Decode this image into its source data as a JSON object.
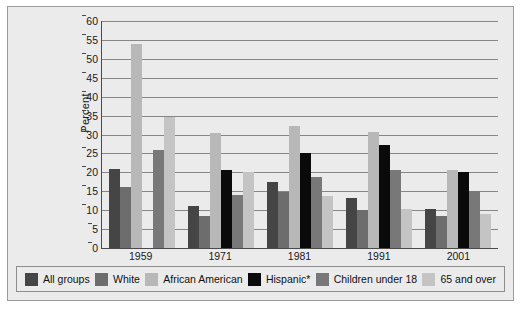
{
  "chart_data": {
    "type": "bar",
    "title": "",
    "xlabel": "",
    "ylabel": "Percent",
    "ylim": [
      0,
      60
    ],
    "ytick_step": 5,
    "grid": true,
    "legend_position": "bottom",
    "categories": [
      "1959",
      "1971",
      "1981",
      "1991",
      "2001"
    ],
    "yticks": [
      "0",
      "5",
      "10",
      "15",
      "20",
      "25",
      "30",
      "35",
      "40",
      "45",
      "50",
      "55",
      "60"
    ],
    "series": [
      {
        "name": "All groups",
        "color": "#454545",
        "values": [
          21.0,
          11.0,
          17.5,
          13.3,
          10.3
        ]
      },
      {
        "name": "White",
        "color": "#6d6d6d",
        "values": [
          16.0,
          8.4,
          14.8,
          10.0,
          8.4
        ]
      },
      {
        "name": "African American",
        "color": "#b8b8b8",
        "values": [
          54.0,
          30.5,
          32.2,
          30.7,
          20.5
        ]
      },
      {
        "name": "Hispanic*",
        "color": "#0a0a0a",
        "values": [
          null,
          20.7,
          25.0,
          27.3,
          20.0
        ]
      },
      {
        "name": "Children under 18",
        "color": "#787878",
        "values": [
          25.8,
          14.0,
          18.7,
          20.6,
          15.2
        ]
      },
      {
        "name": "65 and over",
        "color": "#c4c4c4",
        "values": [
          34.5,
          20.1,
          13.7,
          10.3,
          8.9
        ]
      }
    ]
  },
  "legend": {
    "items": [
      {
        "label": "All groups"
      },
      {
        "label": "White"
      },
      {
        "label": "African American"
      },
      {
        "label": "Hispanic*"
      },
      {
        "label": "Children under 18"
      },
      {
        "label": "65 and over"
      }
    ]
  }
}
